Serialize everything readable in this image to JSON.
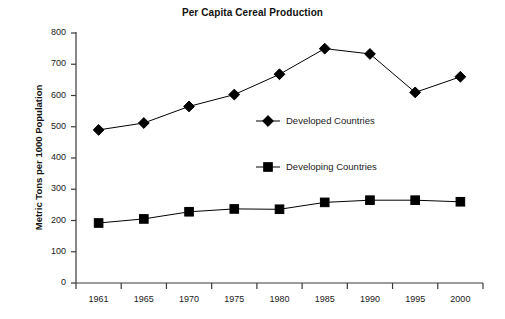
{
  "chart_data": {
    "type": "line",
    "title": "Per Capita Cereal Production",
    "xlabel": "",
    "ylabel": "Metric Tons per 1000 Population",
    "categories": [
      "1961",
      "1965",
      "1970",
      "1975",
      "1980",
      "1985",
      "1990",
      "1995",
      "2000"
    ],
    "ylim": [
      0,
      800
    ],
    "yticks": [
      "0",
      "100",
      "200",
      "300",
      "400",
      "500",
      "600",
      "700",
      "800"
    ],
    "ytick_values": [
      0,
      100,
      200,
      300,
      400,
      500,
      600,
      700,
      800
    ],
    "grid": false,
    "legend_position": "center",
    "series": [
      {
        "name": "Developed Countries",
        "marker": "diamond",
        "color": "#000000",
        "values": [
          490,
          512,
          565,
          603,
          668,
          750,
          733,
          610,
          660
        ]
      },
      {
        "name": "Developing Countries",
        "marker": "square",
        "color": "#000000",
        "values": [
          192,
          205,
          228,
          237,
          236,
          258,
          265,
          265,
          260
        ]
      }
    ]
  },
  "legend": {
    "items": [
      {
        "label": "Developed Countries",
        "marker": "diamond"
      },
      {
        "label": "Developing Countries",
        "marker": "square"
      }
    ]
  },
  "colors": {
    "ink": "#000000",
    "axis": "#3a3a3a",
    "background": "#ffffff"
  }
}
